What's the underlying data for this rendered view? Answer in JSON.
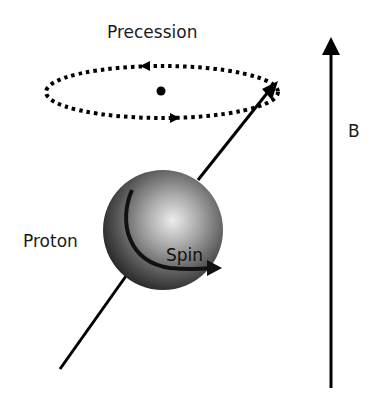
{
  "labels": {
    "precession": "Precession",
    "proton": "Proton",
    "spin": "Spin",
    "field": "B"
  },
  "colors": {
    "ink": "#000000",
    "sphere_highlight": "#e6e6e6",
    "sphere_shadow": "#2a2a2a",
    "background": "#ffffff"
  }
}
